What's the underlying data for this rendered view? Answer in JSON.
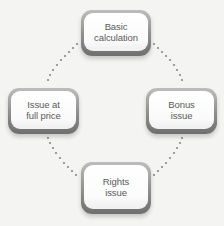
{
  "diagram": {
    "type": "cycle",
    "colors": {
      "background": "#f4f4f3",
      "box_fill": "#ffffff",
      "box_border": "#8e8e8e",
      "text": "#5a5a5a",
      "dots": "#8a8a8a"
    },
    "nodes": [
      {
        "id": "top",
        "label": "Basic\ncalculation"
      },
      {
        "id": "right",
        "label": "Bonus\nissue"
      },
      {
        "id": "bottom",
        "label": "Rights\nissue"
      },
      {
        "id": "left",
        "label": "Issue at\nfull price"
      }
    ],
    "edges": [
      {
        "from": "top",
        "to": "right",
        "style": "dotted"
      },
      {
        "from": "right",
        "to": "bottom",
        "style": "dotted"
      },
      {
        "from": "bottom",
        "to": "left",
        "style": "dotted"
      },
      {
        "from": "left",
        "to": "top",
        "style": "dotted"
      }
    ]
  }
}
